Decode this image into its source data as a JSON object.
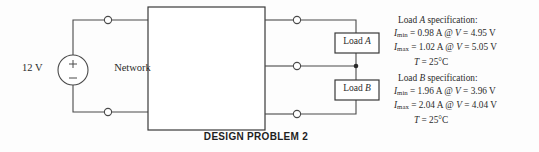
{
  "figure": {
    "caption": "DESIGN PROBLEM 2"
  },
  "circuit": {
    "source": {
      "label": "12 V",
      "plus_sign": "+",
      "minus_sign": "−"
    },
    "network": {
      "label": "Network"
    },
    "loads": [
      {
        "prefix": "Load ",
        "name": "A"
      },
      {
        "prefix": "Load ",
        "name": "B"
      }
    ]
  },
  "specs": [
    {
      "title_prefix": "Load ",
      "title_name": "A",
      "title_suffix": " specification:",
      "imin_symbol": "I",
      "imin_sub": "min",
      "imin_text": " = 0.98 A @ ",
      "imin_v_symbol": "V",
      "imin_v_text": " = 4.95 V",
      "imax_symbol": "I",
      "imax_sub": "max",
      "imax_text": " = 1.02 A @ ",
      "imax_v_symbol": "V",
      "imax_v_text": " = 5.05 V",
      "temp_symbol": "T",
      "temp_text": " = 25°C"
    },
    {
      "title_prefix": "Load ",
      "title_name": "B",
      "title_suffix": " specification:",
      "imin_symbol": "I",
      "imin_sub": "min",
      "imin_text": " = 1.96 A @ ",
      "imin_v_symbol": "V",
      "imin_v_text": " = 3.96 V",
      "imax_symbol": "I",
      "imax_sub": "max",
      "imax_text": " = 2.04 A @ ",
      "imax_v_symbol": "V",
      "imax_v_text": " = 4.04 V",
      "temp_symbol": "T",
      "temp_text": " = 25°C"
    }
  ],
  "colors": {
    "wire": "#4a4a4a",
    "text": "#2b2b2b",
    "background": "#fdfdfd"
  }
}
